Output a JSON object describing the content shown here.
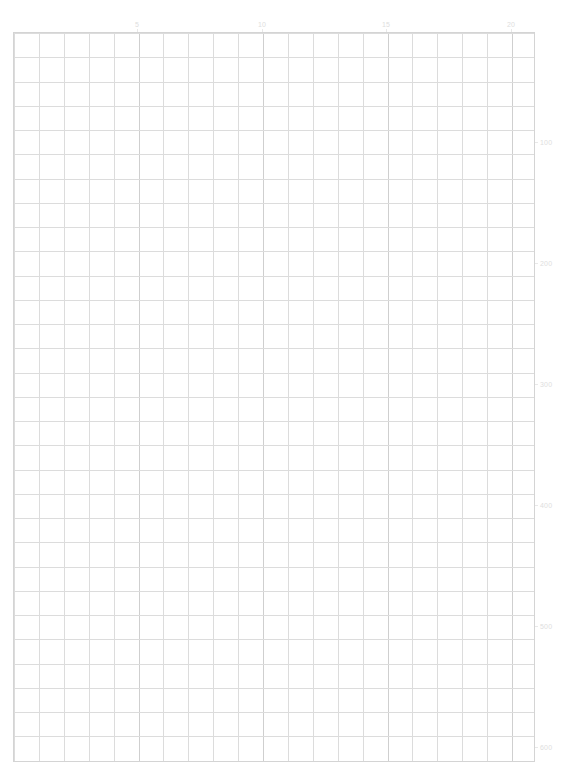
{
  "chart_data": {
    "type": "line",
    "title": "",
    "subtitle": "",
    "xlabel": "",
    "ylabel": "",
    "grid": true,
    "legend": "none",
    "series": [],
    "x": [],
    "values": [],
    "xlim": [
      0,
      21
    ],
    "ylim": [
      0,
      603
    ],
    "x_axis_position": "top",
    "y_axis_position": "right",
    "x_ticks": [
      {
        "value": 5,
        "label": "5",
        "pos_px": 137
      },
      {
        "value": 10,
        "label": "10",
        "pos_px": 262
      },
      {
        "value": 15,
        "label": "15",
        "pos_px": 386
      },
      {
        "value": 20,
        "label": "20",
        "pos_px": 511
      }
    ],
    "y_ticks": [
      {
        "value": 100,
        "label": "100",
        "pos_px": 142
      },
      {
        "value": 200,
        "label": "200",
        "pos_px": 263
      },
      {
        "value": 300,
        "label": "300",
        "pos_px": 384
      },
      {
        "value": 400,
        "label": "400",
        "pos_px": 505
      },
      {
        "value": 500,
        "label": "500",
        "pos_px": 626
      },
      {
        "value": 600,
        "label": "600",
        "pos_px": 747
      }
    ],
    "grid_geometry": {
      "left_px": 13,
      "top_px": 32,
      "width_px": 522,
      "height_px": 730,
      "columns": 21,
      "rows": 30,
      "column_step_px": 24.9,
      "row_step_px": 24.25
    },
    "colors": {
      "background": "#ffffff",
      "gridline_minor": "#dcdcdc",
      "gridline_major": "#cdcdcd",
      "border": "#d4d4d4",
      "tick_label": "#dedede"
    }
  }
}
